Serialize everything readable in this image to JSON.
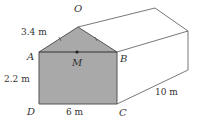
{
  "diagram": {
    "points": {
      "O": "O",
      "A": "A",
      "B": "B",
      "C": "C",
      "D": "D",
      "M": "M"
    },
    "measurements": {
      "slant_OA": "3.4 m",
      "height_AD": "2.2 m",
      "width_DC": "6 m",
      "depth": "10 m"
    },
    "colors": {
      "front_face": "#a9a9a9",
      "lines": "#555555",
      "background": "#ffffff"
    }
  }
}
